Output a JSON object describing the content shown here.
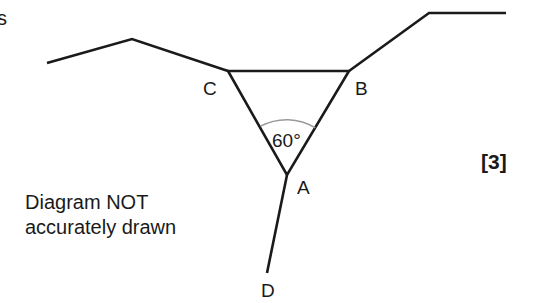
{
  "page": {
    "partial_text": "s",
    "marks": "[3]",
    "note_line1": "Diagram NOT",
    "note_line2": "accurately drawn"
  },
  "diagram": {
    "points": {
      "A": {
        "label": "A",
        "x": 287,
        "y": 175
      },
      "B": {
        "label": "B",
        "x": 349,
        "y": 71
      },
      "C": {
        "label": "C",
        "x": 228,
        "y": 71
      },
      "D": {
        "label": "D",
        "x": 267,
        "y": 273
      }
    },
    "angle_label": "60°",
    "angle_at": "A",
    "angle_between": [
      "AC",
      "AB"
    ],
    "line_color": "#1a1a1a",
    "arc_color": "#9a9a9a",
    "segments": [
      {
        "from": [
          47,
          63
        ],
        "to": [
          132,
          39
        ]
      },
      {
        "from": [
          132,
          39
        ],
        "to": [
          228,
          71
        ]
      },
      {
        "from": [
          228,
          71
        ],
        "to": [
          349,
          71
        ]
      },
      {
        "from": [
          349,
          71
        ],
        "to": [
          429,
          13
        ]
      },
      {
        "from": [
          429,
          13
        ],
        "to": [
          506,
          13
        ]
      },
      {
        "from": [
          228,
          71
        ],
        "to": [
          287,
          175
        ]
      },
      {
        "from": [
          349,
          71
        ],
        "to": [
          287,
          175
        ]
      },
      {
        "from": [
          287,
          175
        ],
        "to": [
          267,
          273
        ]
      }
    ]
  }
}
